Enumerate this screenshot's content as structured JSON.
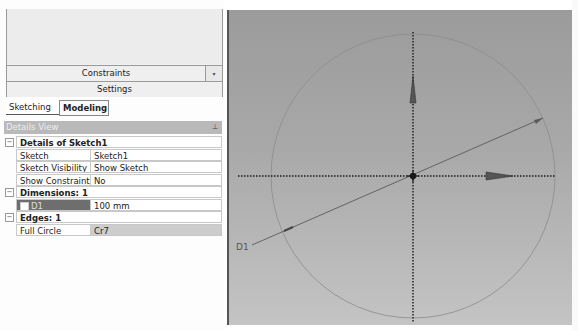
{
  "toolbox": {
    "constraints_label": "Constraints",
    "dropdown_icon": "▾",
    "settings_label": "Settings"
  },
  "tabs": [
    {
      "label": "Sketching",
      "active": true
    },
    {
      "label": "Modeling",
      "active": false
    }
  ],
  "details_view": {
    "title": "Details View",
    "pin_icon": "⊥",
    "groups": [
      {
        "toggle": "−",
        "title": "Details of Sketch1",
        "rows": [
          {
            "label": "Sketch",
            "value": "Sketch1"
          },
          {
            "label": "Sketch Visibility",
            "value": "Show Sketch"
          },
          {
            "label": "Show Constraints?",
            "value": "No"
          }
        ]
      },
      {
        "toggle": "−",
        "title": "Dimensions: 1",
        "rows": [
          {
            "label": "D1",
            "value": "100 mm"
          }
        ]
      },
      {
        "toggle": "−",
        "title": "Edges: 1",
        "rows": [
          {
            "label": "Full Circle",
            "value": "Cr7"
          }
        ]
      }
    ]
  },
  "viewport": {
    "dimension_label": "D1",
    "colors": {
      "axis": "#1a1a1a",
      "circle": "#8a8a8a",
      "dimension_line": "#555555"
    }
  }
}
